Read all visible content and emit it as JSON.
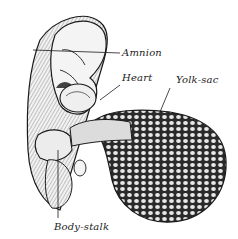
{
  "figure": {
    "style": "monochrome engraving",
    "labels": {
      "amnion": "Amnion",
      "heart": "Heart",
      "yolk_sac": "Yolk-sac",
      "body_stalk": "Body-stalk"
    },
    "colors": {
      "ink": "#1a1a1a",
      "paper": "#ffffff"
    }
  }
}
